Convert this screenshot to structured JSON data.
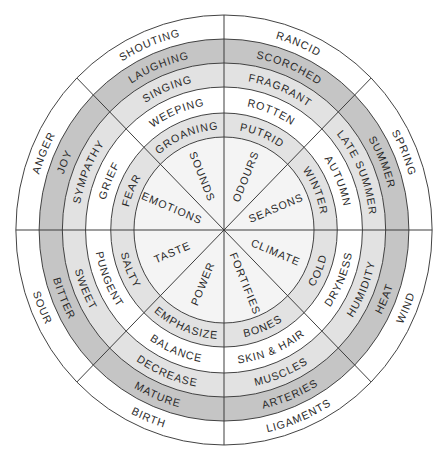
{
  "diagram": {
    "type": "radial-wheel",
    "center": [
      224,
      230
    ],
    "x_scale": 0.968,
    "ring_radii": [
      215,
      191,
      167,
      143,
      117,
      93
    ],
    "ring_fills": [
      "#ffffff",
      "#c5c5c5",
      "#e2e2e2",
      "#ffffff",
      "#e2e2e2"
    ],
    "core_fill": "#f4f4f4",
    "line_color": "#3a3a3a",
    "text_color": "#2a2a2a",
    "core_label_radius": 58,
    "sectors": [
      {
        "id": "odours",
        "start_angle": 45,
        "end_angle": 90,
        "rings": [
          "RANCID",
          "SCORCHED",
          "FRAGRANT",
          "ROTTEN",
          "PUTRID"
        ],
        "core": "ODOURS"
      },
      {
        "id": "sounds",
        "start_angle": 90,
        "end_angle": 135,
        "rings": [
          "SHOUTING",
          "LAUGHING",
          "SINGING",
          "WEEPING",
          "GROANING"
        ],
        "core": "SOUNDS"
      },
      {
        "id": "emotions",
        "start_angle": 135,
        "end_angle": 180,
        "rings": [
          "ANGER",
          "JOY",
          "SYMPATHY",
          "GRIEF",
          "FEAR"
        ],
        "core": "EMOTIONS"
      },
      {
        "id": "taste",
        "start_angle": 180,
        "end_angle": 225,
        "rings": [
          "SOUR",
          "BITTER",
          "SWEET",
          "PUNGENT",
          "SALTY"
        ],
        "core": "TASTE"
      },
      {
        "id": "power",
        "start_angle": 225,
        "end_angle": 270,
        "rings": [
          "BIRTH",
          "MATURE",
          "DECREASE",
          "BALANCE",
          "EMPHASIZE"
        ],
        "core": "POWER"
      },
      {
        "id": "fortifies",
        "start_angle": 270,
        "end_angle": 315,
        "rings": [
          "LIGAMENTS",
          "ARTERIES",
          "MUSCLES",
          "SKIN & HAIR",
          "BONES"
        ],
        "core": "FORTIFIES"
      },
      {
        "id": "climate",
        "start_angle": 315,
        "end_angle": 360,
        "rings": [
          "WIND",
          "HEAT",
          "HUMIDITY",
          "DRYNESS",
          "COLD"
        ],
        "core": "CLIMATE"
      },
      {
        "id": "seasons",
        "start_angle": 0,
        "end_angle": 45,
        "rings": [
          "SPRING",
          "SUMMER",
          "LATE SUMMER",
          "AUTUMN",
          "WINTER"
        ],
        "core": "SEASONS"
      }
    ]
  }
}
